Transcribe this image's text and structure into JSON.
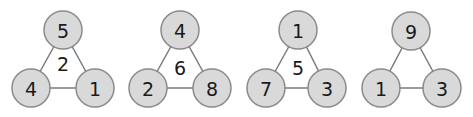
{
  "colors": {
    "node_fill": "#d9d9d9",
    "node_stroke": "#8a8a8a",
    "edge": "#7a7a7a",
    "text": "#1a1a1a"
  },
  "triangles": [
    {
      "top": "5",
      "bottom_left": "4",
      "bottom_right": "1",
      "center": "2",
      "pos": {
        "top": [
          63,
          30
        ],
        "bl": [
          31,
          88
        ],
        "br": [
          95,
          88
        ],
        "center": [
          63,
          64
        ]
      }
    },
    {
      "top": "4",
      "bottom_left": "2",
      "bottom_right": "8",
      "center": "6",
      "pos": {
        "top": [
          180,
          30
        ],
        "bl": [
          148,
          88
        ],
        "br": [
          212,
          88
        ],
        "center": [
          180,
          68
        ]
      }
    },
    {
      "top": "1",
      "bottom_left": "7",
      "bottom_right": "3",
      "center": "5",
      "pos": {
        "top": [
          298,
          30
        ],
        "bl": [
          266,
          88
        ],
        "br": [
          327,
          88
        ],
        "center": [
          298,
          68
        ]
      }
    },
    {
      "top": "9",
      "bottom_left": "1",
      "bottom_right": "3",
      "center": "",
      "pos": {
        "top": [
          411,
          31
        ],
        "bl": [
          381,
          88
        ],
        "br": [
          442,
          88
        ],
        "center": [
          411,
          68
        ]
      }
    }
  ],
  "node_radius": 19
}
